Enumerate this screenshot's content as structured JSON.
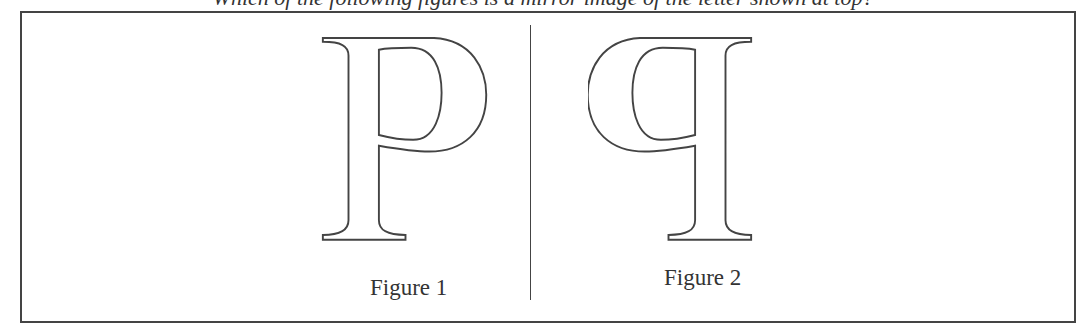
{
  "header": {
    "cut_off_text": "Which of the following figures is a mirror image of the letter shown at top?"
  },
  "figures": [
    {
      "glyph": "P",
      "caption": "Figure 1",
      "mirrored": false
    },
    {
      "glyph": "P",
      "caption": "Figure 2",
      "mirrored": true
    }
  ],
  "colors": {
    "outline": "#444444",
    "background": "#ffffff"
  }
}
